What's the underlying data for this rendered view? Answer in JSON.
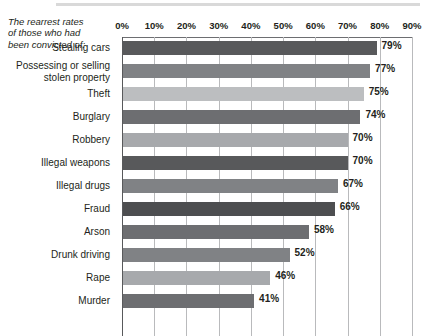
{
  "chart_data": {
    "type": "bar",
    "orientation": "horizontal",
    "title": "The rearrest rates of those who had been convicted of:",
    "title_lines": [
      "The rearrest rates",
      "of those who had",
      "been convicted of:"
    ],
    "xlabel": "",
    "ylabel": "",
    "xlim": [
      0,
      90
    ],
    "xtick_labels": [
      "0%",
      "10%",
      "20%",
      "30%",
      "40%",
      "50%",
      "60%",
      "70%",
      "80%",
      "90%"
    ],
    "xtick_values": [
      0,
      10,
      20,
      30,
      40,
      50,
      60,
      70,
      80,
      90
    ],
    "grid": true,
    "grid_axis": "x",
    "legend": false,
    "value_suffix": "%",
    "categories": [
      "Stealing cars",
      "Possessing or selling stolen property",
      "Theft",
      "Burglary",
      "Robbery",
      "Illegal weapons",
      "Illegal drugs",
      "Fraud",
      "Arson",
      "Drunk driving",
      "Rape",
      "Murder"
    ],
    "values": [
      79,
      77,
      75,
      74,
      70,
      70,
      67,
      66,
      58,
      52,
      46,
      41
    ],
    "value_labels": [
      "79%",
      "77%",
      "75%",
      "74%",
      "70%",
      "70%",
      "67%",
      "66%",
      "58%",
      "52%",
      "46%",
      "41%"
    ],
    "bar_colors": [
      "#58595b",
      "#808285",
      "#bcbec0",
      "#6d6e71",
      "#a7a9ac",
      "#58595b",
      "#808285",
      "#4d4e50",
      "#6d6e71",
      "#808285",
      "#a7a9ac",
      "#6d6e71"
    ]
  },
  "colors": {
    "text": "#231f20",
    "gridline": "#b9babc",
    "axis": "#58595b",
    "top_rule": "#d9d9d9",
    "background": "#ffffff"
  }
}
